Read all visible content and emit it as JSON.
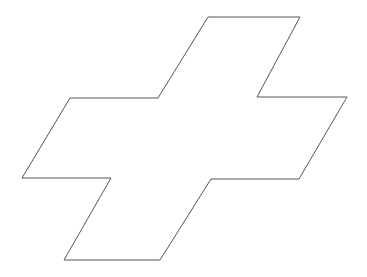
{
  "diagram": {
    "type": "outline-shape",
    "shape": "sheared-cross",
    "background": "#ffffff",
    "stroke": "#555555",
    "stroke_width": 1,
    "fill": "none",
    "points": [
      [
        208,
        17
      ],
      [
        300,
        17
      ],
      [
        257,
        97
      ],
      [
        347,
        97
      ],
      [
        299,
        179
      ],
      [
        211,
        179
      ],
      [
        160,
        260
      ],
      [
        64,
        260
      ],
      [
        111,
        178
      ],
      [
        22,
        178
      ],
      [
        70,
        98
      ],
      [
        158,
        98
      ]
    ]
  }
}
